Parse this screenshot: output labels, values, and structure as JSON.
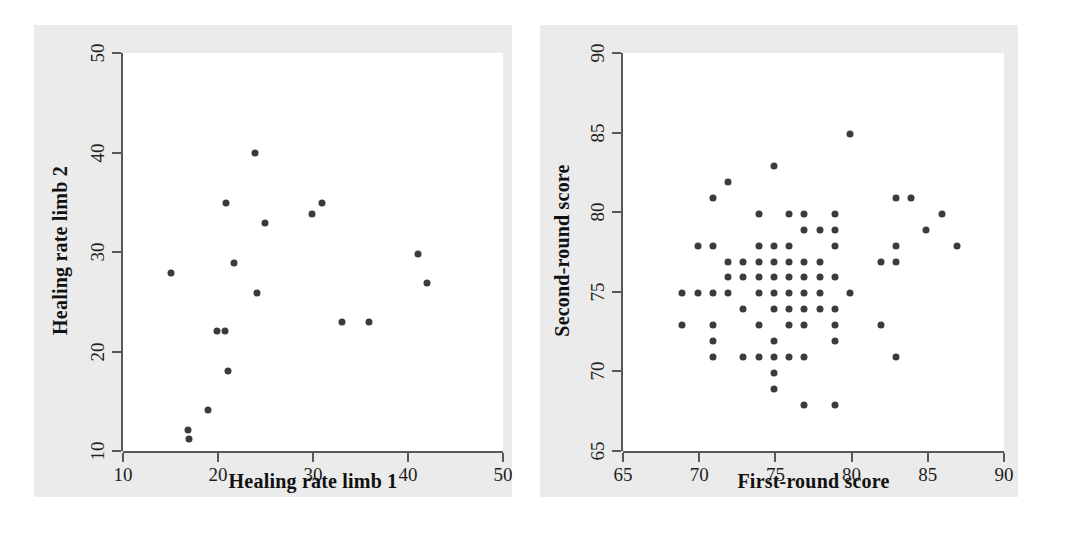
{
  "figure": {
    "background_color": "#ffffff",
    "panel_color": "#ebebeb",
    "plot_color": "#ffffff",
    "axis_color": "#58585a",
    "marker_color": "#3b3b3d"
  },
  "chart_data": [
    {
      "id": "healing-rate",
      "type": "scatter",
      "title": "",
      "xlabel": "Healing rate limb 1",
      "ylabel": "Healing rate limb 2",
      "xlim": [
        10,
        50
      ],
      "ylim": [
        10,
        50
      ],
      "xticks": [
        10,
        20,
        30,
        40,
        50
      ],
      "yticks": [
        10,
        20,
        30,
        40,
        50
      ],
      "xticklabels": [
        "10",
        "20",
        "30",
        "40",
        "50"
      ],
      "yticklabels": [
        "10",
        "20",
        "30",
        "40",
        "50"
      ],
      "grid": false,
      "legend": false,
      "marker_size": 7,
      "points": [
        [
          15.0,
          27.9
        ],
        [
          16.8,
          12.1
        ],
        [
          16.9,
          11.2
        ],
        [
          18.9,
          14.1
        ],
        [
          19.9,
          22.1
        ],
        [
          20.7,
          22.1
        ],
        [
          20.8,
          34.9
        ],
        [
          21.0,
          18.0
        ],
        [
          21.7,
          28.9
        ],
        [
          23.9,
          39.9
        ],
        [
          24.1,
          25.9
        ],
        [
          24.9,
          32.9
        ],
        [
          29.9,
          33.8
        ],
        [
          30.9,
          34.9
        ],
        [
          33.1,
          23.0
        ],
        [
          35.9,
          23.0
        ],
        [
          41.0,
          29.8
        ],
        [
          42.0,
          26.9
        ]
      ]
    },
    {
      "id": "round-scores",
      "type": "scatter",
      "title": "",
      "xlabel": "First-round score",
      "ylabel": "Second-round score",
      "xlim": [
        65,
        90
      ],
      "ylim": [
        65,
        90
      ],
      "xticks": [
        65,
        70,
        75,
        80,
        85,
        90
      ],
      "yticks": [
        65,
        70,
        75,
        80,
        85,
        90
      ],
      "xticklabels": [
        "65",
        "70",
        "75",
        "80",
        "85",
        "90"
      ],
      "yticklabels": [
        "65",
        "70",
        "75",
        "80",
        "85",
        "90"
      ],
      "grid": false,
      "legend": false,
      "marker_size": 7,
      "points": [
        [
          68.9,
          74.9
        ],
        [
          68.9,
          72.9
        ],
        [
          69.9,
          74.9
        ],
        [
          69.9,
          77.9
        ],
        [
          70.9,
          80.9
        ],
        [
          70.9,
          77.9
        ],
        [
          70.9,
          74.9
        ],
        [
          70.9,
          72.9
        ],
        [
          70.9,
          71.9
        ],
        [
          70.9,
          70.9
        ],
        [
          71.9,
          81.9
        ],
        [
          71.9,
          76.9
        ],
        [
          71.9,
          75.9
        ],
        [
          71.9,
          74.9
        ],
        [
          72.9,
          76.9
        ],
        [
          72.9,
          75.9
        ],
        [
          72.9,
          73.9
        ],
        [
          72.9,
          70.9
        ],
        [
          73.9,
          79.9
        ],
        [
          73.9,
          77.9
        ],
        [
          73.9,
          76.9
        ],
        [
          73.9,
          75.9
        ],
        [
          73.9,
          74.9
        ],
        [
          73.9,
          72.9
        ],
        [
          73.9,
          70.9
        ],
        [
          74.9,
          82.9
        ],
        [
          74.9,
          77.9
        ],
        [
          74.9,
          76.9
        ],
        [
          74.9,
          75.9
        ],
        [
          74.9,
          74.9
        ],
        [
          74.9,
          73.9
        ],
        [
          74.9,
          71.9
        ],
        [
          74.9,
          70.9
        ],
        [
          74.9,
          69.9
        ],
        [
          74.9,
          68.9
        ],
        [
          75.9,
          79.9
        ],
        [
          75.9,
          77.9
        ],
        [
          75.9,
          76.9
        ],
        [
          75.9,
          75.9
        ],
        [
          75.9,
          74.9
        ],
        [
          75.9,
          73.9
        ],
        [
          75.9,
          72.9
        ],
        [
          75.9,
          70.9
        ],
        [
          76.9,
          79.9
        ],
        [
          76.9,
          78.9
        ],
        [
          76.9,
          76.9
        ],
        [
          76.9,
          75.9
        ],
        [
          76.9,
          74.9
        ],
        [
          76.9,
          73.9
        ],
        [
          76.9,
          72.9
        ],
        [
          76.9,
          70.9
        ],
        [
          76.9,
          67.9
        ],
        [
          77.9,
          78.9
        ],
        [
          77.9,
          76.9
        ],
        [
          77.9,
          75.9
        ],
        [
          77.9,
          74.9
        ],
        [
          77.9,
          73.9
        ],
        [
          78.9,
          79.9
        ],
        [
          78.9,
          78.9
        ],
        [
          78.9,
          77.9
        ],
        [
          78.9,
          75.9
        ],
        [
          78.9,
          73.9
        ],
        [
          78.9,
          72.9
        ],
        [
          78.9,
          71.9
        ],
        [
          78.9,
          67.9
        ],
        [
          79.9,
          84.9
        ],
        [
          79.9,
          74.9
        ],
        [
          81.9,
          76.9
        ],
        [
          81.9,
          72.9
        ],
        [
          82.9,
          80.9
        ],
        [
          82.9,
          77.9
        ],
        [
          82.9,
          76.9
        ],
        [
          82.9,
          70.9
        ],
        [
          83.9,
          80.9
        ],
        [
          84.9,
          78.9
        ],
        [
          85.9,
          79.9
        ],
        [
          86.9,
          77.9
        ]
      ]
    }
  ]
}
